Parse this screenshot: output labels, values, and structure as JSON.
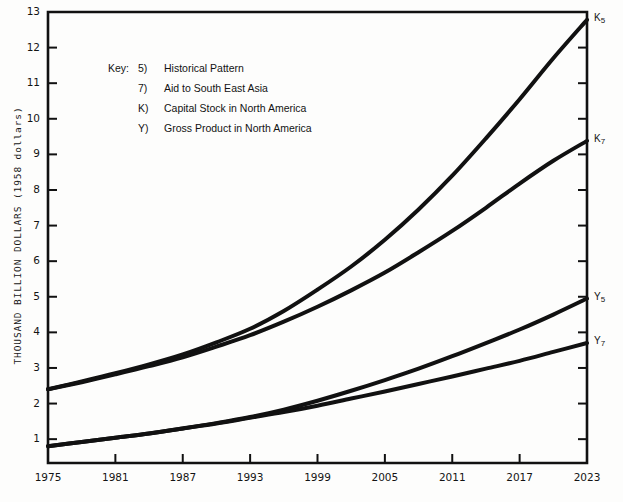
{
  "chart_data": {
    "type": "line",
    "title": "",
    "subtitle": "",
    "xlabel": "",
    "ylabel": "THOUSAND BILLION DOLLARS (1958 dollars)",
    "xlim": [
      1975,
      2023
    ],
    "ylim": [
      0.33,
      13
    ],
    "grid": false,
    "legend_position": "upper-left-inside",
    "legend_title": "Key:",
    "legend_entries": [
      {
        "symbol": "5)",
        "label": "Historical Pattern"
      },
      {
        "symbol": "7)",
        "label": "Aid to South East Asia"
      },
      {
        "symbol": "K)",
        "label": "Capital Stock in North America"
      },
      {
        "symbol": "Y)",
        "label": "Gross Product in North America"
      }
    ],
    "xticks": [
      1975,
      1981,
      1987,
      1993,
      1999,
      2005,
      2011,
      2017,
      2023
    ],
    "xtick_labels": [
      "1975",
      "1981",
      "1987",
      "1993",
      "1999",
      "2005",
      "2011",
      "2017",
      "2023"
    ],
    "yticks": [
      1,
      2,
      3,
      4,
      5,
      6,
      7,
      8,
      9,
      10,
      11,
      12,
      13
    ],
    "ytick_labels": [
      "1",
      "2",
      "3",
      "4",
      "5",
      "6",
      "7",
      "8",
      "9",
      "10",
      "11",
      "12",
      "13"
    ],
    "x": [
      1975,
      1978,
      1981,
      1984,
      1987,
      1990,
      1993,
      1996,
      1999,
      2002,
      2005,
      2008,
      2011,
      2014,
      2017,
      2020,
      2023
    ],
    "series": [
      {
        "name": "K5",
        "end_label": "K",
        "end_sub": "5",
        "description": "Capital Stock in North America - Historical Pattern",
        "values": [
          2.4,
          2.62,
          2.85,
          3.1,
          3.38,
          3.72,
          4.1,
          4.6,
          5.2,
          5.85,
          6.6,
          7.45,
          8.4,
          9.45,
          10.55,
          11.7,
          12.78
        ]
      },
      {
        "name": "K7",
        "end_label": "K",
        "end_sub": "7",
        "description": "Capital Stock in North America - Aid to South East Asia",
        "values": [
          2.4,
          2.6,
          2.82,
          3.05,
          3.3,
          3.6,
          3.92,
          4.3,
          4.72,
          5.18,
          5.68,
          6.25,
          6.85,
          7.5,
          8.18,
          8.82,
          9.38
        ]
      },
      {
        "name": "Y5",
        "end_label": "Y",
        "end_sub": "5",
        "description": "Gross Product in North America - Historical Pattern",
        "values": [
          0.8,
          0.92,
          1.04,
          1.16,
          1.3,
          1.45,
          1.62,
          1.83,
          2.08,
          2.36,
          2.66,
          2.98,
          3.33,
          3.7,
          4.08,
          4.5,
          4.95
        ]
      },
      {
        "name": "Y7",
        "end_label": "Y",
        "end_sub": "7",
        "description": "Gross Product in North America - Aid to South East Asia",
        "values": [
          0.8,
          0.92,
          1.04,
          1.16,
          1.3,
          1.44,
          1.6,
          1.76,
          1.94,
          2.14,
          2.34,
          2.55,
          2.76,
          2.98,
          3.2,
          3.45,
          3.7
        ]
      }
    ],
    "style": {
      "line_color": "#111111",
      "line_width": 4,
      "axis_color": "#111111",
      "background": "#fdfdfc"
    }
  }
}
